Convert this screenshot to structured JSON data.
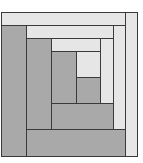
{
  "diagram": {
    "type": "log-cabin-quilt-block",
    "colors": {
      "light": "#e6e6e6",
      "dark": "#a9a9a9",
      "seam": "#3a3a3a"
    },
    "patches": [
      {
        "name": "outer-top-light",
        "tone": "light",
        "x": 1,
        "y": 12,
        "w": 125,
        "h": 14
      },
      {
        "name": "outer-right-light",
        "tone": "light",
        "x": 125,
        "y": 12,
        "w": 13,
        "h": 145
      },
      {
        "name": "outer-left-dark",
        "tone": "dark",
        "x": 1,
        "y": 25,
        "w": 26,
        "h": 132
      },
      {
        "name": "outer-bottom-dark",
        "tone": "dark",
        "x": 26,
        "y": 129,
        "w": 100,
        "h": 28
      },
      {
        "name": "ring2-top-light",
        "tone": "light",
        "x": 26,
        "y": 25,
        "w": 88,
        "h": 14
      },
      {
        "name": "ring2-right-light",
        "tone": "light",
        "x": 113,
        "y": 25,
        "w": 13,
        "h": 105
      },
      {
        "name": "ring2-left-dark",
        "tone": "dark",
        "x": 26,
        "y": 38,
        "w": 26,
        "h": 92
      },
      {
        "name": "ring2-bottom-dark",
        "tone": "dark",
        "x": 51,
        "y": 103,
        "w": 63,
        "h": 27
      },
      {
        "name": "ring3-top-light",
        "tone": "light",
        "x": 51,
        "y": 38,
        "w": 50,
        "h": 14
      },
      {
        "name": "ring3-right-light",
        "tone": "light",
        "x": 100,
        "y": 38,
        "w": 14,
        "h": 66
      },
      {
        "name": "ring3-left-dark",
        "tone": "dark",
        "x": 51,
        "y": 51,
        "w": 26,
        "h": 53
      },
      {
        "name": "center-light",
        "tone": "light",
        "x": 76,
        "y": 51,
        "w": 25,
        "h": 27
      },
      {
        "name": "center-dark",
        "tone": "dark",
        "x": 76,
        "y": 77,
        "w": 25,
        "h": 27
      }
    ]
  }
}
